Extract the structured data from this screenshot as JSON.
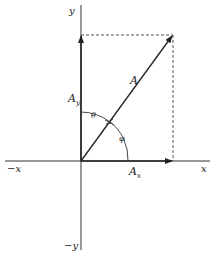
{
  "diagram": {
    "type": "vector-components",
    "axes": {
      "x_pos_label": "x",
      "x_neg_label": "−x",
      "y_pos_label": "y",
      "y_neg_label": "−y"
    },
    "vector": {
      "label": "A",
      "x_component_label": "A",
      "x_component_subscript": "x",
      "y_component_label": "A",
      "y_component_subscript": "y"
    },
    "angles": {
      "theta_label": "θ",
      "phi_label": "φ"
    },
    "colors": {
      "line": "#222222",
      "dashed": "#555555",
      "background": "#ffffff"
    }
  }
}
